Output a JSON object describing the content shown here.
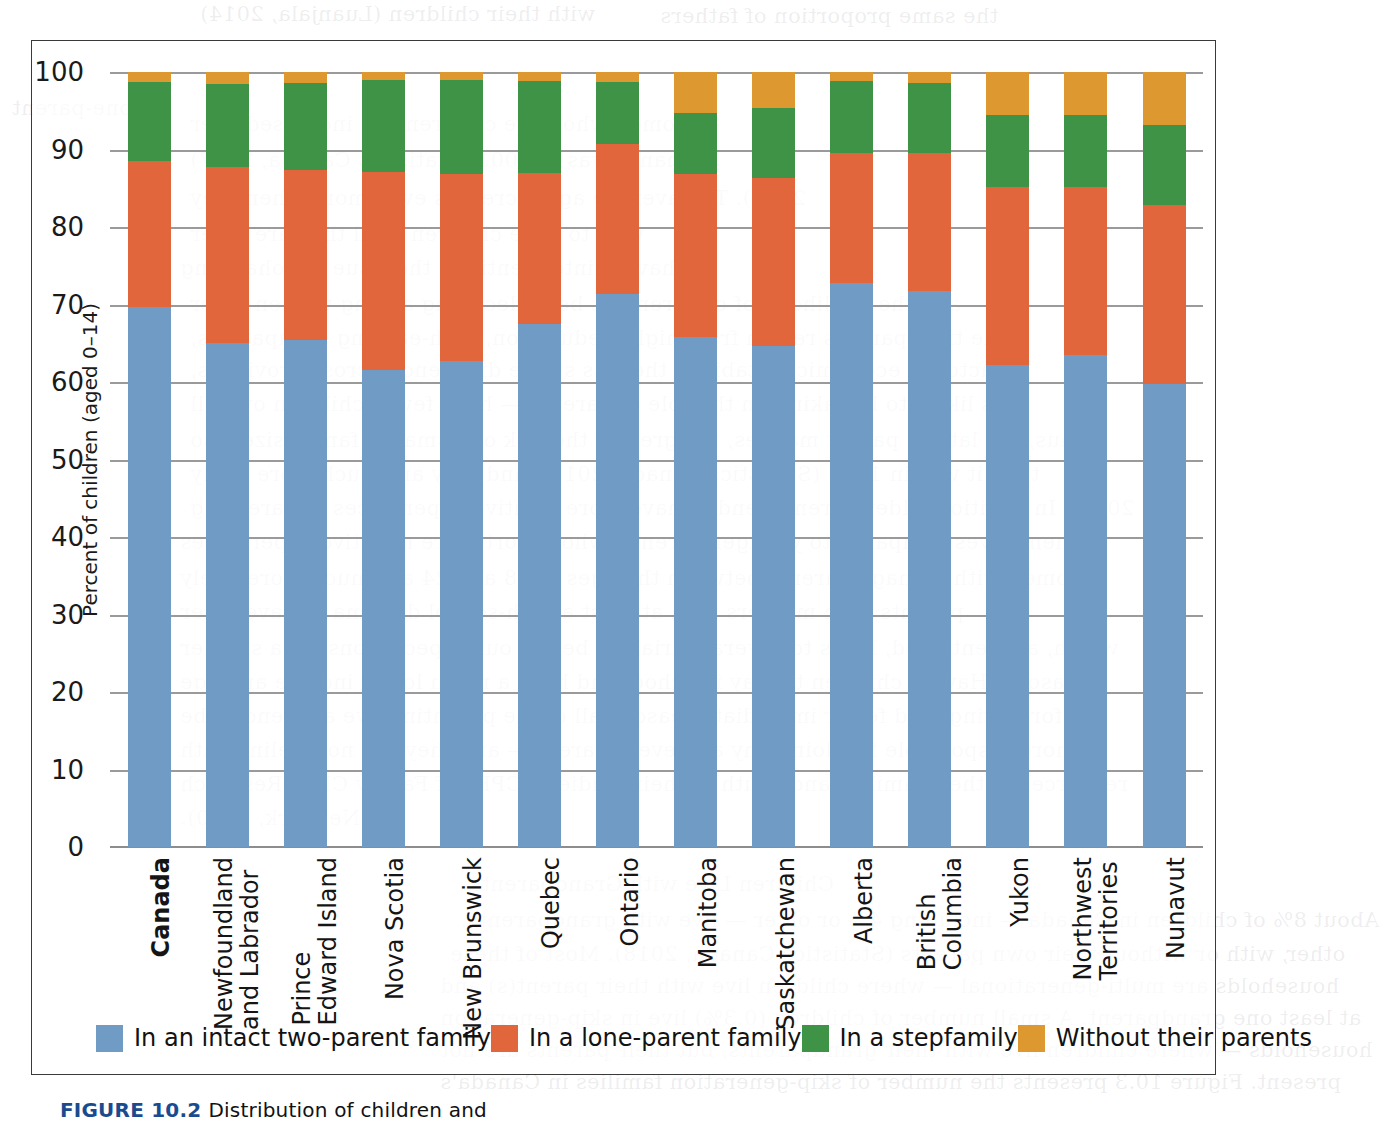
{
  "figure": {
    "caption_prefix": "FIGURE 10.2",
    "caption_rest": "Distribution of children and"
  },
  "colors": {
    "intact": "#6f9bc4",
    "lone": "#e2663c",
    "step": "#3f9347",
    "without": "#dd9930",
    "gridline": "#9a9a9a",
    "frame": "#3a3a3a"
  },
  "legend": {
    "items": [
      {
        "label": "In an intact two-parent family",
        "color_key": "intact"
      },
      {
        "label": "In a lone-parent family",
        "color_key": "lone"
      },
      {
        "label": "In a stepfamily",
        "color_key": "step"
      },
      {
        "label": "Without their parents",
        "color_key": "without"
      }
    ]
  },
  "bleed_text": [
    {
      "x": 200,
      "y": 2,
      "text": "with their children (Luanjala, 2014)"
    },
    {
      "x": 660,
      "y": 4,
      "text": "the same proportion of fathers"
    },
    {
      "x": 12,
      "y": 96,
      "text": "lone-parent"
    },
    {
      "x": 190,
      "y": 112,
      "text": "women who have children has increased over"
    },
    {
      "x": 190,
      "y": 148,
      "text": "than it was in 2001 (Statistics Canada, 2017)"
    },
    {
      "x": 190,
      "y": 186,
      "text": "2012). The average age increases even more when they"
    },
    {
      "x": 190,
      "y": 222,
      "text": "wait to have children until they are older"
    },
    {
      "x": 180,
      "y": 256,
      "text": "having into-identified the issue of cohabiting"
    },
    {
      "x": 190,
      "y": 292,
      "text": "and the likelihood of children has been declining among women older"
    },
    {
      "x": 190,
      "y": 326,
      "text": "the time parents return from higher education, high-earning occupations,"
    },
    {
      "x": 190,
      "y": 358,
      "text": "factor in economic instability, the less stable difference across provinces,"
    },
    {
      "x": 190,
      "y": 392,
      "text": "less likely to be taking on the role of parents — have fewer children overall"
    },
    {
      "x": 190,
      "y": 428,
      "text": "Thus, the later a parent marries, the greater the risk of a smaller family size also"
    },
    {
      "x": 190,
      "y": 462,
      "text": "than it was in 1961 (Statistics Canada, 2017), and they are much more likely"
    },
    {
      "x": 190,
      "y": 496,
      "text": "2011). In addition, older parents tend to have more positive experiences in parenting"
    },
    {
      "x": 180,
      "y": 530,
      "text": "themselves compared to younger parents, who report more negative experiences"
    },
    {
      "x": 180,
      "y": 566,
      "text": "women with teenage parents between the ages of 18 and 24 are much more likely"
    },
    {
      "x": 180,
      "y": 600,
      "text": "parents than mothers with at least a high-school diploma to have older"
    },
    {
      "x": 180,
      "y": 636,
      "text": "which, as mentioned, leads to several variables below, our expectations for a smaller"
    },
    {
      "x": 180,
      "y": 670,
      "text": "reasons. Having children to stay in school and have a much lower income and age"
    },
    {
      "x": 180,
      "y": 704,
      "text": "for lasting, and fewer immediate reasons all of the parenting; we are tend to be"
    },
    {
      "x": 180,
      "y": 738,
      "text": "more responsible for doing any and every parent — and they are not feeling with"
    },
    {
      "x": 180,
      "y": 772,
      "text": "resources of their families and youth in their studies (ICPH) of Family Child Research"
    },
    {
      "x": 180,
      "y": 806,
      "text": "Network, 2010)."
    },
    {
      "x": 470,
      "y": 872,
      "text": "Children Live with Grandparents"
    },
    {
      "x": 460,
      "y": 908,
      "text": "About 8% of children in Canada — including 4% or older — live with grandparents,"
    },
    {
      "x": 450,
      "y": 942,
      "text": "other, with or without their own parents (Statistics Canada, 2018). Most of these"
    },
    {
      "x": 440,
      "y": 974,
      "text": "households are multi-generational — where children live with their parent(s) and"
    },
    {
      "x": 440,
      "y": 1006,
      "text": "at least one grandparent. A small number of children (0.3%) live in skip-generation"
    },
    {
      "x": 440,
      "y": 1038,
      "text": "households — where children live with their grandparents, but their parents are not"
    },
    {
      "x": 440,
      "y": 1070,
      "text": "present. Figure 10.3 presents the number of skip-generation families in Canada's"
    }
  ],
  "chart_data": {
    "type": "bar",
    "subtype": "stacked-100-percent",
    "title": "",
    "xlabel": "",
    "ylabel": "Percent of children (aged 0–14)",
    "ylim": [
      0,
      100
    ],
    "yticks": [
      0,
      10,
      20,
      30,
      40,
      50,
      60,
      70,
      80,
      90,
      100
    ],
    "grid": true,
    "legend_position": "bottom",
    "categories": [
      "Canada",
      "Newfoundland and Labrador",
      "Prince Edward Island",
      "Nova Scotia",
      "New Brunswick",
      "Quebec",
      "Ontario",
      "Manitoba",
      "Saskatchewan",
      "Alberta",
      "British Columbia",
      "Yukon",
      "Northwest Territories",
      "Nunavut"
    ],
    "categories_display": [
      {
        "lines": [
          "Canada"
        ],
        "bold": true
      },
      {
        "lines": [
          "Newfoundland",
          "and Labrador"
        ],
        "bold": false
      },
      {
        "lines": [
          "Prince",
          "Edward Island"
        ],
        "bold": false
      },
      {
        "lines": [
          "Nova Scotia"
        ],
        "bold": false
      },
      {
        "lines": [
          "New Brunswick"
        ],
        "bold": false
      },
      {
        "lines": [
          "Quebec"
        ],
        "bold": false
      },
      {
        "lines": [
          "Ontario"
        ],
        "bold": false
      },
      {
        "lines": [
          "Manitoba"
        ],
        "bold": false
      },
      {
        "lines": [
          "Saskatchewan"
        ],
        "bold": false
      },
      {
        "lines": [
          "Alberta"
        ],
        "bold": false
      },
      {
        "lines": [
          "British",
          "Columbia"
        ],
        "bold": false
      },
      {
        "lines": [
          "Yukon"
        ],
        "bold": false
      },
      {
        "lines": [
          "Northwest",
          "Territories"
        ],
        "bold": false
      },
      {
        "lines": [
          "Nunavut"
        ],
        "bold": false
      }
    ],
    "series": [
      {
        "name": "In an intact two-parent family",
        "color": "#6f9bc4",
        "values": [
          69.7,
          65.0,
          65.4,
          61.5,
          62.7,
          67.5,
          71.3,
          65.8,
          64.7,
          72.8,
          71.8,
          62.2,
          63.5,
          59.7
        ]
      },
      {
        "name": "In a lone-parent family",
        "color": "#e2663c",
        "values": [
          18.8,
          22.8,
          22.0,
          25.6,
          24.2,
          19.5,
          19.4,
          21.0,
          21.6,
          16.8,
          17.8,
          23.0,
          21.6,
          23.2
        ]
      },
      {
        "name": "In a stepfamily",
        "color": "#3f9347",
        "values": [
          10.2,
          10.7,
          11.2,
          11.9,
          12.1,
          11.9,
          8.0,
          7.9,
          9.0,
          9.3,
          9.0,
          9.3,
          9.3,
          10.3
        ]
      },
      {
        "name": "Without their parents",
        "color": "#dd9930",
        "values": [
          1.3,
          1.5,
          1.4,
          1.0,
          1.0,
          1.1,
          1.3,
          5.3,
          4.7,
          1.1,
          1.4,
          5.5,
          5.6,
          6.8
        ]
      }
    ]
  }
}
